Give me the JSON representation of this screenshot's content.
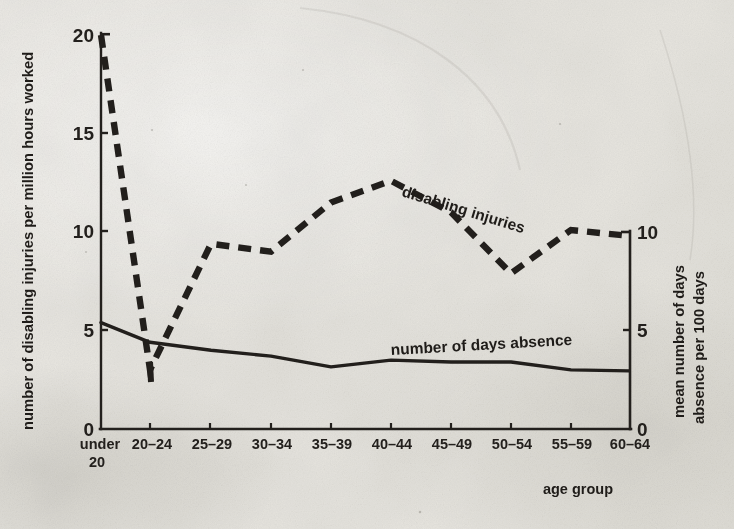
{
  "chart_data": {
    "type": "line",
    "title": "",
    "xlabel": "age group",
    "categories": [
      "under 20",
      "20–24",
      "25–29",
      "30–34",
      "35–39",
      "40–44",
      "45–49",
      "50–54",
      "55–59",
      "60–64"
    ],
    "category_labels_multiline": [
      [
        "under",
        "20"
      ],
      [
        "20–24"
      ],
      [
        "25–29"
      ],
      [
        "30–34"
      ],
      [
        "35–39"
      ],
      [
        "40–44"
      ],
      [
        "45–49"
      ],
      [
        "50–54"
      ],
      [
        "55–59"
      ],
      [
        "60–64"
      ]
    ],
    "grid": false,
    "legend": "inline-labels",
    "axes": {
      "left": {
        "label": "number of disabling injuries per million hours worked",
        "ticks": [
          0,
          5,
          10,
          15,
          20
        ],
        "tick_labels": [
          "0",
          "5",
          "10",
          "15",
          "20"
        ],
        "ylim": [
          0,
          20
        ]
      },
      "right": {
        "label": "mean number of days absence per 100 days",
        "ticks": [
          0,
          5,
          10
        ],
        "tick_labels": [
          "0",
          "5",
          "10"
        ],
        "ylim": [
          0,
          20
        ]
      },
      "x": {
        "label": "age group"
      }
    },
    "series": [
      {
        "name": "disabling injuries",
        "axis": "left",
        "style": "dashed",
        "color": "#221f1c",
        "label_text": "disabling  injuries",
        "values": [
          20.0,
          3.0,
          9.4,
          9.0,
          11.5,
          12.6,
          11.0,
          7.9,
          10.1,
          9.8
        ]
      },
      {
        "name": "number of days absence",
        "axis": "right",
        "style": "solid",
        "color": "#221f1c",
        "label_text": "number of days absence",
        "values_left_scale": [
          5.4,
          4.4,
          4.0,
          3.7,
          3.15,
          3.5,
          3.4,
          3.4,
          3.0,
          2.95
        ],
        "values": [
          5.4,
          4.4,
          4.0,
          3.7,
          3.15,
          3.5,
          3.4,
          3.4,
          3.0,
          2.95
        ]
      }
    ]
  },
  "labels": {
    "y_left_title": "number of disabling injuries per million hours worked",
    "y_right_title_line1": "mean number of days",
    "y_right_title_line2": "absence per 100 days",
    "x_axis_title": "age group",
    "series_dashed": "disabling  injuries",
    "series_solid": "number of days absence",
    "y_left_ticks": [
      "20",
      "15",
      "10",
      "5",
      "0"
    ],
    "y_right_ticks": [
      "10",
      "5",
      "0"
    ],
    "x_ticks": [
      "under",
      "20",
      "20–24",
      "25–29",
      "30–34",
      "35–39",
      "40–44",
      "45–49",
      "50–54",
      "55–59",
      "60–64"
    ]
  }
}
